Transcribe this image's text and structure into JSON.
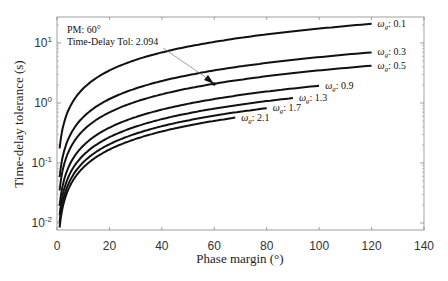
{
  "chart_data": {
    "type": "line",
    "title": "",
    "xlabel": "Phase margin (°)",
    "ylabel": "Time-delay tolerance (s)",
    "xlim": [
      0,
      140
    ],
    "ylim": [
      0.008,
      30
    ],
    "yscale": "log",
    "grid": false,
    "legend": "none (inline labels)",
    "xticks": [
      0,
      20,
      40,
      60,
      80,
      100,
      120,
      140
    ],
    "yticks": [
      "10^-2",
      "10^-1",
      "10^0",
      "10^1"
    ],
    "series": [
      {
        "name": "ω_g: 0.1",
        "x": [
          1,
          2,
          5,
          10,
          20,
          40,
          60,
          80,
          100,
          120
        ],
        "y": [
          0.17,
          0.35,
          0.87,
          1.75,
          3.5,
          7.0,
          10.5,
          14.0,
          17.5,
          20.9
        ]
      },
      {
        "name": "ω_g: 0.3",
        "x": [
          1,
          2,
          5,
          10,
          20,
          40,
          60,
          80,
          100,
          120
        ],
        "y": [
          0.058,
          0.116,
          0.29,
          0.58,
          1.16,
          2.33,
          3.49,
          4.65,
          5.82,
          6.98
        ]
      },
      {
        "name": "ω_g: 0.5",
        "x": [
          1,
          2,
          5,
          10,
          20,
          40,
          60,
          80,
          100,
          120
        ],
        "y": [
          0.035,
          0.07,
          0.175,
          0.35,
          0.7,
          1.4,
          2.094,
          2.79,
          3.49,
          4.19
        ]
      },
      {
        "name": "ω_g: 0.9",
        "x": [
          1,
          2,
          5,
          10,
          20,
          40,
          60,
          80,
          100
        ],
        "y": [
          0.019,
          0.039,
          0.097,
          0.19,
          0.39,
          0.78,
          1.16,
          1.55,
          1.94
        ]
      },
      {
        "name": "ω_g: 1.3",
        "x": [
          1,
          2,
          5,
          10,
          20,
          40,
          60,
          80,
          90
        ],
        "y": [
          0.013,
          0.027,
          0.067,
          0.13,
          0.27,
          0.54,
          0.81,
          1.07,
          1.21
        ]
      },
      {
        "name": "ω_g: 1.7",
        "x": [
          1,
          2,
          5,
          10,
          20,
          40,
          60,
          80
        ],
        "y": [
          0.01,
          0.021,
          0.051,
          0.1,
          0.21,
          0.41,
          0.62,
          0.82
        ]
      },
      {
        "name": "ω_g: 2.1",
        "x": [
          1,
          2,
          5,
          10,
          20,
          40,
          60,
          68
        ],
        "y": [
          0.0083,
          0.017,
          0.042,
          0.083,
          0.17,
          0.33,
          0.5,
          0.57
        ]
      }
    ],
    "annotations": [
      {
        "text": "PM: 60°",
        "x": 60,
        "y": 2.094
      },
      {
        "text": "Time-Delay Tol: 2.094",
        "x": 60,
        "y": 2.094
      }
    ]
  },
  "labels": {
    "xlabel": "Phase margin (°)",
    "ylabel": "Time-delay tolerance (s)",
    "annot_line1": "PM: 60°",
    "annot_line2": "Time-Delay Tol: 2.094",
    "xticks": [
      "0",
      "20",
      "40",
      "60",
      "80",
      "100",
      "120",
      "140"
    ],
    "curves": [
      "0.1",
      "0.3",
      "0.5",
      "0.9",
      "1.3",
      "1.7",
      "2.1"
    ]
  }
}
